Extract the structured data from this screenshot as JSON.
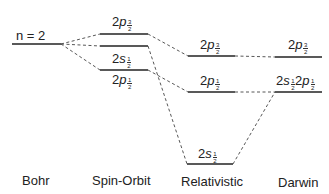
{
  "diagram": {
    "columns": [
      {
        "id": "bohr",
        "label": "Bohr"
      },
      {
        "id": "spin_orbit",
        "label": "Spin-Orbit"
      },
      {
        "id": "relativistic",
        "label": "Relativistic"
      },
      {
        "id": "darwin",
        "label": "Darwin"
      }
    ],
    "levels": {
      "bohr": {
        "label": "n = 2"
      },
      "so_2p32": {
        "main": "2",
        "orb": "p",
        "num": "3",
        "den": "2"
      },
      "so_2s12": {
        "main": "2",
        "orb": "s",
        "num": "1",
        "den": "2"
      },
      "so_2p12": {
        "main": "2",
        "orb": "p",
        "num": "1",
        "den": "2"
      },
      "rel_2p32": {
        "main": "2",
        "orb": "p",
        "num": "3",
        "den": "2"
      },
      "rel_2p12": {
        "main": "2",
        "orb": "p",
        "num": "1",
        "den": "2"
      },
      "rel_2s12": {
        "main": "2",
        "orb": "s",
        "num": "1",
        "den": "2"
      },
      "dar_2p32": {
        "main": "2",
        "orb": "p",
        "num": "3",
        "den": "2"
      },
      "dar_2s12": {
        "main": "2",
        "orb": "s",
        "num": "1",
        "den": "2"
      },
      "dar_2p12": {
        "main": "2",
        "orb": "p",
        "num": "1",
        "den": "2"
      }
    },
    "colors": {
      "line": "#222222",
      "dash": "#444444"
    }
  }
}
